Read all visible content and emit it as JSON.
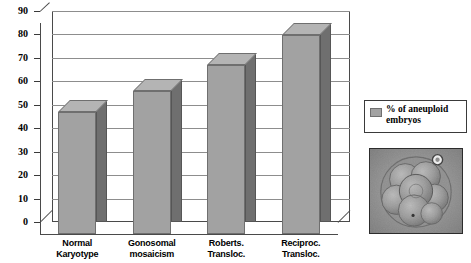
{
  "chart_data": {
    "type": "bar",
    "title": "",
    "xlabel": "",
    "ylabel": "",
    "ylim": [
      0,
      90
    ],
    "ytick_step": 10,
    "grid": true,
    "legend_position": "right",
    "categories": [
      "Normal Karyotype",
      "Gonosomal mosaicism",
      "Roberts. Transloc.",
      "Reciproc. Transloc."
    ],
    "category_lines": [
      [
        "Normal",
        "Karyotype"
      ],
      [
        "Gonosomal",
        "mosaicism"
      ],
      [
        "Roberts.",
        "Transloc."
      ],
      [
        "Reciproc.",
        "Transloc."
      ]
    ],
    "series": [
      {
        "name": "% of aneuploid embryos",
        "values": [
          52,
          61,
          72,
          85
        ]
      }
    ],
    "yticks": [
      "0",
      "10",
      "20",
      "30",
      "40",
      "50",
      "60",
      "70",
      "80",
      "90"
    ]
  },
  "legend": {
    "entries": [
      {
        "label": "% of aneuploid embryos",
        "color": "#a2a2a2"
      }
    ]
  },
  "photo": {
    "name": "embryo-micrograph",
    "description": "grayscale micrograph of a multicellular human embryo"
  },
  "colors": {
    "bar_front": "#a2a2a2",
    "bar_side": "#6f6f6f",
    "bar_top": "#b4b4b4",
    "gridline": "#8d8d8d",
    "axis": "#3a3a3a",
    "background": "#ffffff"
  }
}
